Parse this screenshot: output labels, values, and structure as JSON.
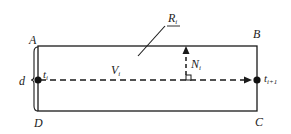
{
  "diagram": {
    "type": "road-segment-schematic",
    "corners": {
      "A": "A",
      "B": "B",
      "C": "C",
      "D": "D"
    },
    "width_label": "d",
    "start_point": {
      "label": "t",
      "sub": "i"
    },
    "end_point": {
      "label": "t",
      "sub": "i+1"
    },
    "direction_vector": {
      "label": "V",
      "sub": "i"
    },
    "normal_vector": {
      "label": "N",
      "sub": "i"
    },
    "region": {
      "label": "R",
      "sub": "i"
    },
    "colors": {
      "stroke": "#1a1a1a",
      "background": "#ffffff"
    }
  }
}
